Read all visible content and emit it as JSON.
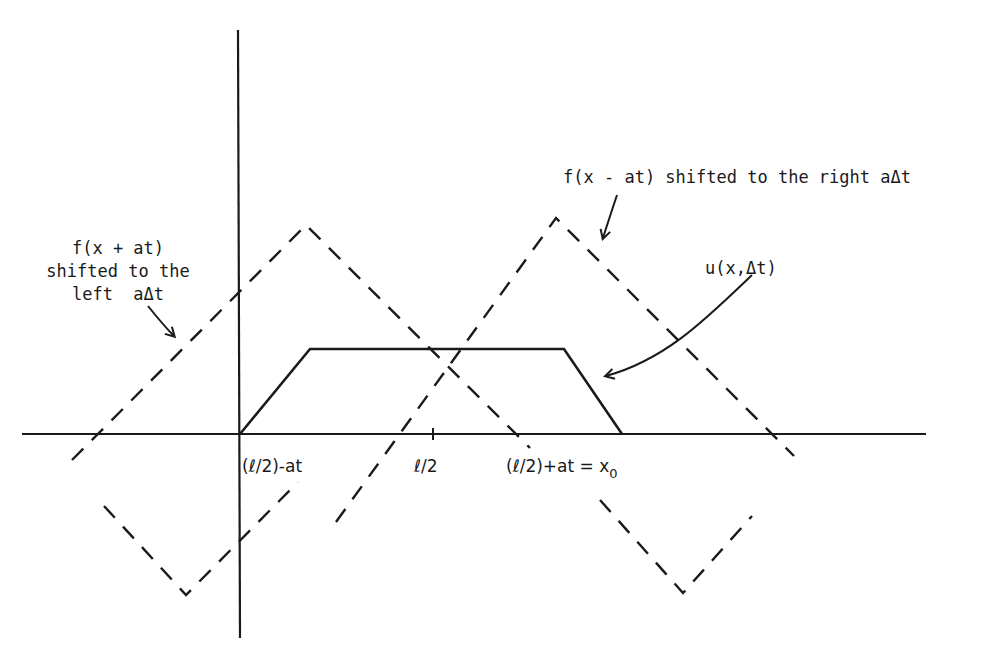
{
  "diagram": {
    "type": "wave-superposition-sketch",
    "axes": {
      "x_axis": {
        "x1": 22,
        "x2": 926,
        "y": 434
      },
      "y_axis": {
        "x": 238,
        "y1": 30,
        "y2": 638
      }
    },
    "tick_labels": [
      {
        "id": "left",
        "text": "(ℓ/2)-at",
        "x": 242,
        "y": 472
      },
      {
        "id": "mid",
        "text": "ℓ/2",
        "x": 414,
        "y": 472
      },
      {
        "id": "right",
        "text": "(ℓ/2)+at = x",
        "sub": "0",
        "x": 506,
        "y": 472
      }
    ],
    "annotations": {
      "right_shift": {
        "line1": "f(x - at)  shifted to the right aΔt"
      },
      "left_shift": {
        "line1": "f(x + at)",
        "line2": "shifted to the",
        "line3": "left  aΔt"
      },
      "sum": {
        "line1": "u(x,Δt)"
      }
    },
    "curves": {
      "f_left_dashed": {
        "label": "f(x + at)",
        "points": [
          [
            72,
            460
          ],
          [
            306,
            225
          ],
          [
            530,
            448
          ]
        ],
        "lower_points": [
          [
            104,
            506
          ],
          [
            186,
            595
          ],
          [
            298,
            482
          ]
        ]
      },
      "f_right_dashed": {
        "label": "f(x - at)",
        "points": [
          [
            336,
            522
          ],
          [
            556,
            218
          ],
          [
            794,
            456
          ]
        ],
        "lower_points": [
          [
            600,
            500
          ],
          [
            683,
            593
          ],
          [
            752,
            516
          ]
        ]
      },
      "u_solid": {
        "label": "u(x,Δt)",
        "points": [
          [
            240,
            434
          ],
          [
            310,
            349
          ],
          [
            564,
            349
          ],
          [
            622,
            434
          ]
        ]
      }
    },
    "colors": {
      "ink": "#1a1a1a",
      "background": "#ffffff"
    }
  }
}
